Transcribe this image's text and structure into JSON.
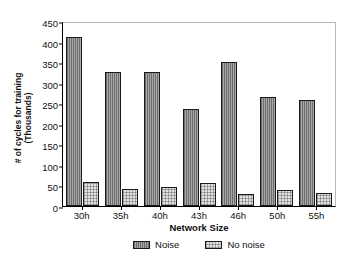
{
  "chart_data": {
    "type": "bar",
    "title": "",
    "xlabel": "Network Size",
    "ylabel": "# of cycles for training (Thousands)",
    "ylabel_line1": "# of cycles for training",
    "ylabel_line2": "(Thousands)",
    "categories": [
      "30h",
      "35h",
      "40h",
      "43h",
      "46h",
      "50h",
      "55h"
    ],
    "series": [
      {
        "name": "Noise",
        "values": [
          412,
          325,
          325,
          235,
          350,
          265,
          257
        ]
      },
      {
        "name": "No noise",
        "values": [
          58,
          42,
          46,
          55,
          30,
          39,
          31
        ]
      }
    ],
    "ylim": [
      0,
      450
    ],
    "yticks": [
      450,
      400,
      350,
      300,
      250,
      200,
      150,
      100,
      50,
      0
    ],
    "ytick_labels": [
      "450",
      "400",
      "350",
      "300",
      "250",
      "200",
      "150",
      "100",
      "50",
      "0"
    ],
    "grid": false,
    "legend_position": "bottom",
    "legend": [
      "Noise",
      "No noise"
    ],
    "colors": {
      "noise_fill": "#a8a8a8",
      "no_noise_fill": "#e2e2e2",
      "bar_outline": "#1a1a1a",
      "axis": "#000000",
      "frame": "#b9b9b9",
      "background": "#ffffff"
    }
  }
}
